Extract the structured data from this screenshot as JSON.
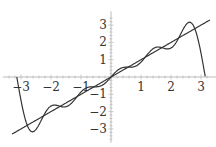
{
  "chart_data": {
    "type": "line",
    "title": "",
    "xlabel": "",
    "ylabel": "",
    "xlim": [
      -3.3,
      3.3
    ],
    "ylim": [
      -3.6,
      3.6
    ],
    "grid": false,
    "x_ticks": [
      -3,
      -2,
      -1,
      1,
      2,
      3
    ],
    "y_ticks": [
      -3,
      -2,
      -1,
      1,
      2,
      3
    ],
    "x_tick_labels": [
      "−3",
      "−2",
      "−1",
      "1",
      "2",
      "3"
    ],
    "y_tick_labels": [
      "−3",
      "−2",
      "−1",
      "1",
      "2",
      "3"
    ],
    "series": [
      {
        "name": "y = x",
        "function": "x",
        "domain": [
          -3.3,
          3.3
        ],
        "color": "#333333"
      },
      {
        "name": "Fourier partial sum (5 terms)",
        "function": "2*sum_{n=1..5} (-1)^(n+1) sin(n x)/n",
        "domain": [
          -3.1416,
          3.1416
        ],
        "color": "#333333"
      }
    ],
    "sample_points": {
      "x": [
        -3.14,
        -2.7,
        -2.0,
        -1.0,
        0,
        1.0,
        2.0,
        2.7,
        3.14
      ],
      "line_y": [
        -3.14,
        -2.7,
        -2.0,
        -1.0,
        0,
        1.0,
        2.0,
        2.7,
        3.14
      ],
      "fourier_y": [
        0,
        -3.3,
        -1.9,
        -1.0,
        0,
        1.0,
        1.9,
        3.3,
        0
      ]
    }
  },
  "axes": {
    "color": "#bbbbbb",
    "line_color": "#333333"
  }
}
